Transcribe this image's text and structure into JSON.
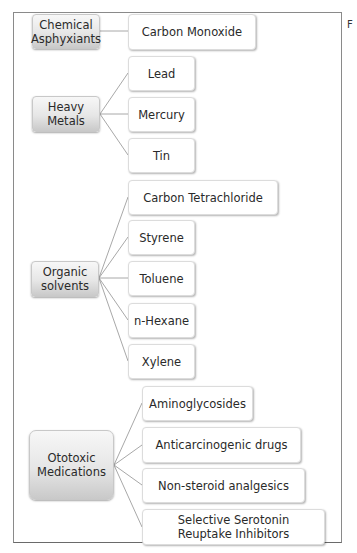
{
  "side_letter": "F",
  "groups": [
    {
      "label": "Chemical Asphyxiants",
      "line1": "Chemical",
      "line2": "Asphyxiants",
      "items": [
        "Carbon Monoxide"
      ]
    },
    {
      "label": "Heavy Metals",
      "line1": "Heavy",
      "line2": "Metals",
      "items": [
        "Lead",
        "Mercury",
        "Tin"
      ]
    },
    {
      "label": "Organic solvents",
      "line1": "Organic",
      "line2": "solvents",
      "items": [
        "Carbon Tetrachloride",
        "Styrene",
        "Toluene",
        "n-Hexane",
        "Xylene"
      ]
    },
    {
      "label": "Ototoxic Medications",
      "line1": "Ototoxic",
      "line2": "Medications",
      "items": [
        "Aminoglycosides",
        "Anticarcinogenic drugs",
        "Non-steroid analgesics",
        "Selective Serotonin Reuptake Inhibitors"
      ]
    }
  ],
  "colors": {
    "connector": "#a8a8a8",
    "frame": "#8a8a8a"
  }
}
